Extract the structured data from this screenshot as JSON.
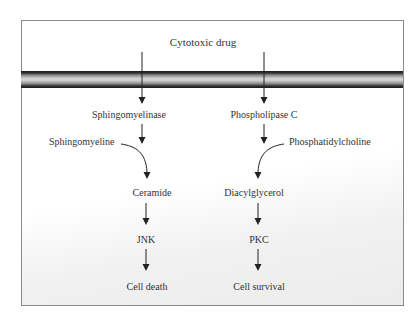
{
  "diagram": {
    "title_node": "Cytotoxic drug",
    "left_pathway": {
      "enzyme": "Sphingomyelinase",
      "substrate": "Sphingomyeline",
      "product": "Ceramide",
      "kinase": "JNK",
      "outcome": "Cell death"
    },
    "right_pathway": {
      "enzyme": "Phospholipase C",
      "substrate": "Phosphatidylcholine",
      "product": "Diacylglycerol",
      "kinase": "PKC",
      "outcome": "Cell survival"
    },
    "colors": {
      "frame_border": "#8a8a8a",
      "membrane_dark": "#1a1a1a",
      "membrane_light": "#d6d6d6",
      "text": "#333333",
      "arrow": "#222222"
    }
  }
}
